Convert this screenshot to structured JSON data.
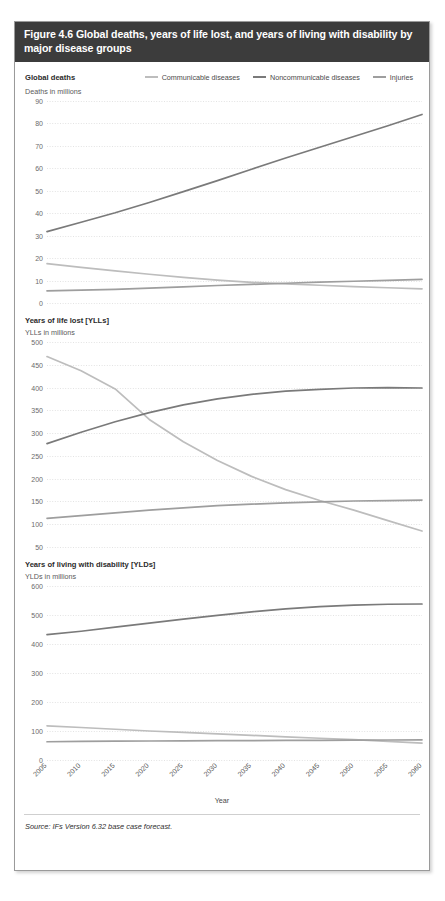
{
  "figure": {
    "title": "Figure 4.6 Global deaths, years of life lost, and years of living with disability by major disease groups",
    "source": "Source: IFs Version 6.32 base case forecast.",
    "xaxis_title": "Year"
  },
  "legend": {
    "items": [
      {
        "label": "Communicable diseases",
        "color": "#bdbdbd"
      },
      {
        "label": "Noncommunicable diseases",
        "color": "#7a7a7a"
      },
      {
        "label": "Injuries",
        "color": "#9e9e9e"
      }
    ]
  },
  "colors": {
    "header_bg": "#3c3c3c",
    "header_text": "#ffffff",
    "grid": "#e3e3e3",
    "card_border": "#9a9a9a",
    "communicable": "#bdbdbd",
    "noncommunicable": "#7a7a7a",
    "injuries": "#9e9e9e"
  },
  "panels": [
    {
      "name": "global-deaths",
      "title": "Global deaths",
      "unit": "Deaths in millions"
    },
    {
      "name": "years-of-life-lost",
      "title": "Years of life lost [YLLs]",
      "unit": "YLLs in millions"
    },
    {
      "name": "years-living-with-disability",
      "title": "Years of living with disability [YLDs]",
      "unit": "YLDs in millions"
    }
  ],
  "chart_data": [
    {
      "type": "line",
      "title": "Global deaths",
      "xlabel": "Year",
      "ylabel": "Deaths in millions",
      "x": [
        2005,
        2010,
        2015,
        2020,
        2025,
        2030,
        2035,
        2040,
        2045,
        2050,
        2055,
        2060
      ],
      "xlim": [
        2005,
        2060
      ],
      "ylim": [
        0,
        90
      ],
      "yticks": [
        0,
        10,
        20,
        30,
        40,
        50,
        60,
        70,
        80,
        90
      ],
      "grid": true,
      "legend": "top",
      "series": [
        {
          "name": "Communicable diseases",
          "color": "#bdbdbd",
          "values": [
            17.5,
            15.9,
            14.3,
            12.8,
            11.4,
            10.2,
            9.2,
            8.5,
            7.9,
            7.3,
            6.8,
            6.3
          ]
        },
        {
          "name": "Noncommunicable diseases",
          "color": "#7a7a7a",
          "values": [
            31.8,
            36.0,
            40.2,
            44.8,
            49.6,
            54.5,
            59.6,
            64.6,
            69.4,
            74.2,
            79.0,
            84.0
          ]
        },
        {
          "name": "Injuries",
          "color": "#9e9e9e",
          "values": [
            5.4,
            5.7,
            6.1,
            6.6,
            7.2,
            7.8,
            8.3,
            8.8,
            9.3,
            9.7,
            10.1,
            10.5
          ]
        }
      ]
    },
    {
      "type": "line",
      "title": "Years of life lost [YLLs]",
      "xlabel": "Year",
      "ylabel": "YLLs in millions",
      "x": [
        2005,
        2010,
        2015,
        2020,
        2025,
        2030,
        2035,
        2040,
        2045,
        2050,
        2055,
        2060
      ],
      "xlim": [
        2005,
        2060
      ],
      "ylim": [
        50,
        500
      ],
      "yticks": [
        50,
        100,
        150,
        200,
        250,
        300,
        350,
        400,
        450,
        500
      ],
      "grid": true,
      "legend": "top",
      "series": [
        {
          "name": "Communicable diseases",
          "color": "#bdbdbd",
          "values": [
            468,
            437,
            397,
            330,
            281,
            240,
            205,
            176,
            152,
            131,
            108,
            85
          ]
        },
        {
          "name": "Noncommunicable diseases",
          "color": "#7a7a7a",
          "values": [
            277,
            302,
            325,
            345,
            362,
            375,
            385,
            392,
            396,
            399,
            400,
            399
          ]
        },
        {
          "name": "Injuries",
          "color": "#9e9e9e",
          "values": [
            113,
            119,
            125,
            131,
            136,
            141,
            144,
            147,
            149,
            151,
            152,
            153
          ]
        }
      ]
    },
    {
      "type": "line",
      "title": "Years of living with disability [YLDs]",
      "xlabel": "Year",
      "ylabel": "YLDs in millions",
      "x": [
        2005,
        2010,
        2015,
        2020,
        2025,
        2030,
        2035,
        2040,
        2045,
        2050,
        2055,
        2060
      ],
      "xlim": [
        2005,
        2060
      ],
      "ylim": [
        0,
        600
      ],
      "yticks": [
        0,
        100,
        200,
        300,
        400,
        500,
        600
      ],
      "grid": true,
      "legend": "top",
      "series": [
        {
          "name": "Communicable diseases",
          "color": "#bdbdbd",
          "values": [
            118,
            112,
            106,
            100,
            95,
            90,
            85,
            80,
            75,
            70,
            64,
            58
          ]
        },
        {
          "name": "Noncommunicable diseases",
          "color": "#7a7a7a",
          "values": [
            432,
            444,
            458,
            472,
            486,
            499,
            511,
            521,
            529,
            534,
            537,
            538
          ]
        },
        {
          "name": "Injuries",
          "color": "#9e9e9e",
          "values": [
            63,
            64,
            65,
            65.5,
            66,
            66.5,
            67,
            67.5,
            68,
            68.5,
            69,
            69.5
          ]
        }
      ]
    }
  ],
  "xtick_labels": [
    "2005",
    "2010",
    "2015",
    "2020",
    "2025",
    "2030",
    "2035",
    "2040",
    "2045",
    "2050",
    "2055",
    "2060"
  ]
}
